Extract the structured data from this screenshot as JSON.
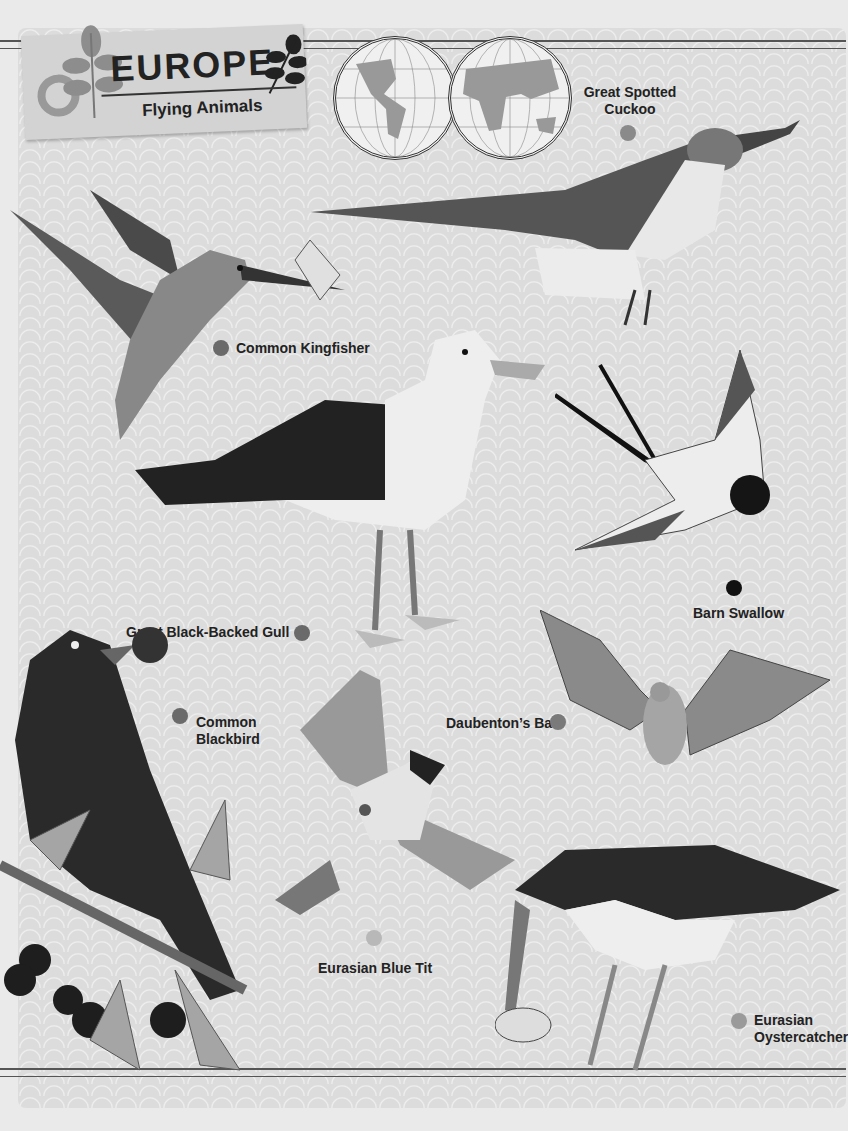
{
  "header": {
    "title": "EUROPE",
    "subtitle": "Flying Animals"
  },
  "colors": {
    "background": "#dcdcdc",
    "dot_dark": "#111111",
    "dot_mid": "#6a6a6a",
    "dot_light": "#a8a8a8"
  },
  "animals": [
    {
      "name": "Great Spotted Cuckoo",
      "line1": "Great Spotted",
      "line2": "Cuckoo",
      "dot": "#8a8a8a"
    },
    {
      "name": "Common Kingfisher",
      "line1": "Common Kingfisher",
      "dot": "#6a6a6a"
    },
    {
      "name": "Great Black-Backed Gull",
      "line1": "Great Black-Backed Gull",
      "dot": "#6a6a6a"
    },
    {
      "name": "Barn Swallow",
      "line1": "Barn Swallow",
      "dot": "#111111"
    },
    {
      "name": "Common Blackbird",
      "line1": "Common",
      "line2": "Blackbird",
      "dot": "#6a6a6a"
    },
    {
      "name": "Daubenton's Bat",
      "line1": "Daubenton’s Bat",
      "dot": "#7a7a7a"
    },
    {
      "name": "Eurasian Blue Tit",
      "line1": "Eurasian Blue Tit",
      "dot": "#b8b8b8"
    },
    {
      "name": "Eurasian Oystercatcher",
      "line1": "Eurasian",
      "line2": "Oystercatcher",
      "dot": "#9a9a9a"
    }
  ]
}
